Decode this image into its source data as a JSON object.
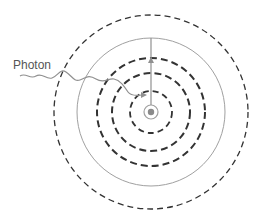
{
  "diagram": {
    "labels": {
      "photon": "Photon"
    },
    "center": {
      "x": 151,
      "y": 112
    },
    "colors": {
      "dashed_orbit": "#333333",
      "solid_orbit": "#a0a0a0",
      "photon": "#909090",
      "nucleus": "#8a8a8a"
    },
    "orbits": [
      {
        "type": "dashed",
        "radius": 21
      },
      {
        "type": "dashed",
        "radius": 39
      },
      {
        "type": "dashed",
        "radius": 54
      },
      {
        "type": "solid",
        "radius": 74
      },
      {
        "type": "dashed",
        "radius": 97
      }
    ]
  }
}
